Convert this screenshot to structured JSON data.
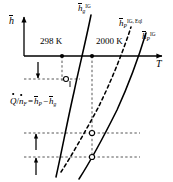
{
  "figure": {
    "background_color": "#ffffff",
    "line_color": "#000000",
    "width": 173,
    "height": 182
  },
  "axes": {
    "y_label": "h",
    "y_label_accent": "overbar",
    "x_label": "T",
    "x_label_accent": "none",
    "origin": {
      "x": 24,
      "y": 56
    },
    "x_axis_end": {
      "x": 166,
      "y": 56
    },
    "y_axis_top": {
      "x": 24,
      "y": 14
    }
  },
  "ticks": [
    {
      "name": "tick-298k",
      "label": "298 K",
      "x": 62,
      "y": 56,
      "label_x": 40,
      "label_y": 38
    },
    {
      "name": "tick-2000k",
      "label": "2000 K",
      "x": 92,
      "y": 56,
      "label_x": 96,
      "label_y": 38
    }
  ],
  "curves": [
    {
      "name": "curve-hg-ig",
      "label": "h",
      "label_accent": "overbar",
      "label_sub": "g",
      "label_sup": "IG",
      "style": "solid",
      "label_x": 79,
      "label_y": 4,
      "path": "M 56 177 L 62 139 L 68 107 L 74 80 L 79 58 L 83 42 L 87 28 L 91 15"
    },
    {
      "name": "curve-hp-ig-eql",
      "label": "h",
      "label_accent": "overbar",
      "label_sub": "P",
      "label_sup": "IG, Eql",
      "style": "dashed",
      "label_x": 120,
      "label_y": 18,
      "path": "M 62 171 L 72 154 L 82 137 L 91 119 L 100 100 L 109 80 L 117 60 L 124 42 L 130 26"
    },
    {
      "name": "curve-hp-ig",
      "label": "h",
      "label_accent": "overbar",
      "label_sub": "P",
      "label_sup": "IG",
      "style": "solid",
      "label_x": 142,
      "label_y": 31,
      "path": "M 79 177 L 88 163 L 97 147 L 106 129 L 114 110 L 122 90 L 130 70 L 138 50 L 145 32"
    }
  ],
  "markers": [
    {
      "name": "marker-hg-298k",
      "x": 66,
      "y": 79,
      "type": "open-circle"
    },
    {
      "name": "marker-eql-2000k",
      "x": 92,
      "y": 133,
      "type": "open-circle"
    },
    {
      "name": "marker-hp-2000k",
      "x": 92,
      "y": 157,
      "type": "open-circle"
    }
  ],
  "guide_lines": [
    {
      "name": "vline-298k",
      "x1": 62,
      "y1": 56,
      "x2": 62,
      "y2": 81,
      "style": "dashed"
    },
    {
      "name": "vline-2000k",
      "x1": 92,
      "y1": 56,
      "x2": 92,
      "y2": 160,
      "style": "dashed"
    },
    {
      "name": "hline-hg-298k",
      "x1": 24,
      "y1": 79,
      "x2": 80,
      "y2": 79,
      "style": "dashed"
    },
    {
      "name": "hline-eql-2000k",
      "x1": 24,
      "y1": 133,
      "x2": 140,
      "y2": 133,
      "style": "dashed"
    },
    {
      "name": "hline-hp-2000k",
      "x1": 24,
      "y1": 157,
      "x2": 140,
      "y2": 157,
      "style": "dashed"
    }
  ],
  "arrows": [
    {
      "name": "arrow-down-hg",
      "x": 38,
      "y1": 63,
      "y2": 79,
      "direction": "down"
    },
    {
      "name": "arrow-up-eql",
      "x": 36,
      "y1": 150,
      "y2": 133,
      "direction": "up"
    },
    {
      "name": "arrow-up-hp",
      "x": 36,
      "y1": 175,
      "y2": 157,
      "direction": "up"
    }
  ],
  "equation": {
    "name": "heat-release-equation",
    "x": 11,
    "y": 97,
    "parts": {
      "q_symbol": "Q",
      "q_accent": "dot",
      "slash": "/",
      "n_symbol": "n",
      "n_accent": "dot",
      "n_sub": "F",
      "equals": "=",
      "hp_symbol": "h",
      "hp_accent": "overbar",
      "hp_sub": "P",
      "minus": "−",
      "hg_symbol": "h",
      "hg_accent": "overbar",
      "hg_sub": "g"
    },
    "plain_text": "Q/nF = hP - hg"
  }
}
